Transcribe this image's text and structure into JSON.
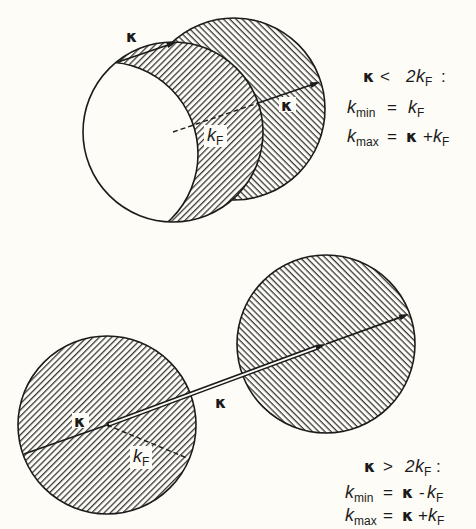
{
  "colors": {
    "background": "#fdfcf6",
    "ink": "#1b1b1b",
    "hatch": "#3a3a3a"
  },
  "top_panel": {
    "label_kappa_shift": "κ",
    "label_kappa_arrow": "κ",
    "label_radius": {
      "main": "k",
      "sub": "F"
    },
    "condition": {
      "kappa": "κ",
      "op": "<",
      "coef": "2",
      "k": "k",
      "sub": "F",
      "colon": ":"
    },
    "kmin": {
      "k": "k",
      "sub": "min",
      "eq": "=",
      "rhs_k": "k",
      "rhs_sub": "F"
    },
    "kmax": {
      "k": "k",
      "sub": "max",
      "eq": "=",
      "rhs_kappa": "κ",
      "rhs_op": "+",
      "rhs_k": "k",
      "rhs_sub": "F"
    }
  },
  "bottom_panel": {
    "label_kappa_inner": "κ",
    "label_kappa_between": "κ",
    "label_radius": {
      "main": "k",
      "sub": "F"
    },
    "condition": {
      "kappa": "κ",
      "op": ">",
      "coef": "2",
      "k": "k",
      "sub": "F",
      "colon": ":"
    },
    "kmin": {
      "k": "k",
      "sub": "min",
      "eq": "=",
      "rhs_kappa": "κ",
      "rhs_op": "-",
      "rhs_k": "k",
      "rhs_sub": "F"
    },
    "kmax": {
      "k": "k",
      "sub": "max",
      "eq": "=",
      "rhs_kappa": "κ",
      "rhs_op": "+",
      "rhs_k": "k",
      "rhs_sub": "F"
    }
  }
}
